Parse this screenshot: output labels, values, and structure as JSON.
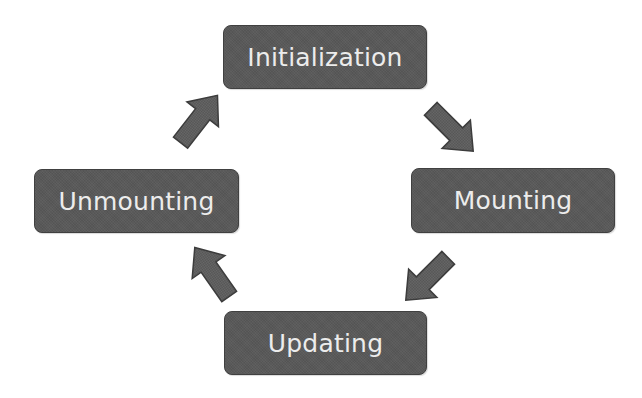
{
  "diagram": {
    "type": "cycle",
    "colors": {
      "node_fill": "#595959",
      "node_border": "#404040",
      "node_text": "#ececec",
      "arrow_fill": "#5e5e5e",
      "arrow_stroke": "#3c3c3c",
      "background": "#ffffff"
    },
    "nodes": [
      {
        "id": "initialization",
        "label": "Initialization"
      },
      {
        "id": "mounting",
        "label": "Mounting"
      },
      {
        "id": "updating",
        "label": "Updating"
      },
      {
        "id": "unmounting",
        "label": "Unmounting"
      }
    ],
    "edges": [
      {
        "from": "initialization",
        "to": "mounting",
        "direction": "down-right"
      },
      {
        "from": "mounting",
        "to": "updating",
        "direction": "down-left"
      },
      {
        "from": "updating",
        "to": "unmounting",
        "direction": "up-left"
      },
      {
        "from": "unmounting",
        "to": "initialization",
        "direction": "up-right"
      }
    ]
  }
}
